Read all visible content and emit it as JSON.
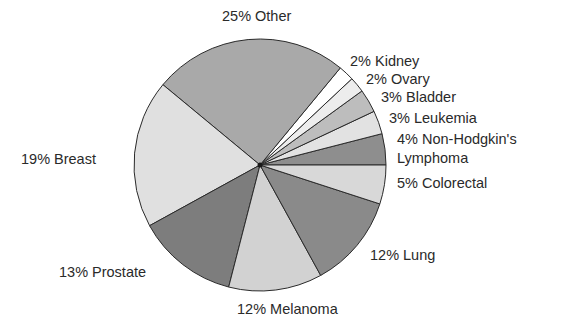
{
  "chart_data": {
    "type": "pie",
    "title": "",
    "start_angle_deg": 0,
    "direction": "counterclockwise-from-right",
    "slices": [
      {
        "label": "Non-Hodgkin's Lymphoma",
        "value": 4,
        "display": "4% Non-Hodgkin's Lymphoma",
        "color": "#8e8e8e"
      },
      {
        "label": "Leukemia",
        "value": 3,
        "display": "3% Leukemia",
        "color": "#e2e2e2"
      },
      {
        "label": "Bladder",
        "value": 3,
        "display": "3% Bladder",
        "color": "#bdbdbd"
      },
      {
        "label": "Ovary",
        "value": 2,
        "display": "2% Ovary",
        "color": "#ededed"
      },
      {
        "label": "Kidney",
        "value": 2,
        "display": "2% Kidney",
        "color": "#ffffff"
      },
      {
        "label": "Other",
        "value": 25,
        "display": "25% Other",
        "color": "#a9a9a9"
      },
      {
        "label": "Breast",
        "value": 19,
        "display": "19% Breast",
        "color": "#e0e0e0"
      },
      {
        "label": "Prostate",
        "value": 13,
        "display": "13% Prostate",
        "color": "#7d7d7d"
      },
      {
        "label": "Melanoma",
        "value": 12,
        "display": "12% Melanoma",
        "color": "#d2d2d2"
      },
      {
        "label": "Lung",
        "value": 12,
        "display": "12% Lung",
        "color": "#8a8a8a"
      },
      {
        "label": "Colorectal",
        "value": 5,
        "display": "5% Colorectal",
        "color": "#d8d8d8"
      }
    ],
    "legend": "none (labels placed outside slices)"
  },
  "labels": {
    "other": "25% Other",
    "kidney": "2% Kidney",
    "ovary": "2% Ovary",
    "bladder": "3% Bladder",
    "leukemia": "3% Leukemia",
    "nhl_line1": "4% Non-Hodgkin's",
    "nhl_line2": "Lymphoma",
    "colorectal": "5% Colorectal",
    "lung": "12% Lung",
    "melanoma": "12% Melanoma",
    "prostate": "13% Prostate",
    "breast": "19% Breast"
  }
}
